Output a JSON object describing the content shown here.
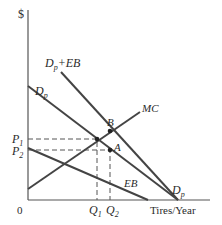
{
  "diagram": {
    "type": "economics-supply-demand",
    "y_axis_label": "$",
    "x_axis_label": "Tires/Year",
    "origin_label": "0",
    "curves": [
      {
        "id": "dp_plus_eb",
        "label_main": "D",
        "label_sub": "p",
        "label_suffix": "+EB"
      },
      {
        "id": "dp",
        "label_main": "D",
        "label_sub": "p"
      },
      {
        "id": "mc",
        "label_main": "MC"
      },
      {
        "id": "eb",
        "label_main": "EB"
      }
    ],
    "price_labels": [
      {
        "main": "P",
        "sub": "1"
      },
      {
        "main": "P",
        "sub": "2"
      }
    ],
    "quantity_labels": [
      {
        "main": "Q",
        "sub": "1"
      },
      {
        "main": "Q",
        "sub": "2"
      }
    ],
    "points": [
      {
        "label": "B"
      },
      {
        "label": "A"
      }
    ],
    "dp_end_label": {
      "main": "D",
      "sub": "p"
    }
  }
}
